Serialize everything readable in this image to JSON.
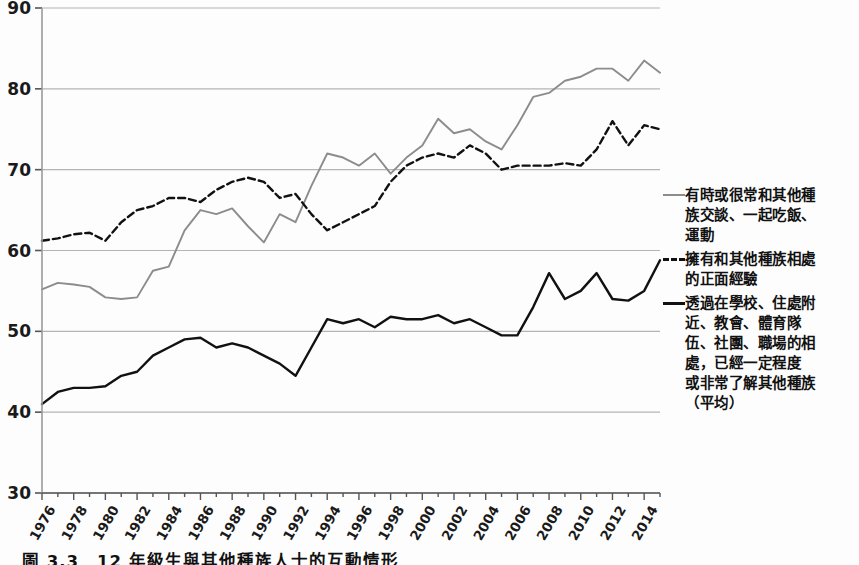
{
  "chart_data": {
    "type": "line",
    "title": "",
    "xlabel": "",
    "ylabel": "",
    "ylim": [
      30,
      90
    ],
    "xlim": [
      1976,
      2015
    ],
    "ytick_values": [
      30,
      40,
      50,
      60,
      70,
      80,
      90
    ],
    "ytick_labels": [
      "30",
      "40",
      "50",
      "60",
      "70",
      "80",
      "90"
    ],
    "grid": true,
    "grid_axis": "y",
    "legend_position": "right",
    "xtick_labels": [
      "1976",
      "1978",
      "1980",
      "1982",
      "1984",
      "1986",
      "1988",
      "1990",
      "1992",
      "1994",
      "1996",
      "1998",
      "2000",
      "2002",
      "2004",
      "2006",
      "2008",
      "2010",
      "2012",
      "2014"
    ],
    "x": [
      1976,
      1977,
      1978,
      1979,
      1980,
      1981,
      1982,
      1983,
      1984,
      1985,
      1986,
      1987,
      1988,
      1989,
      1990,
      1991,
      1992,
      1993,
      1994,
      1995,
      1996,
      1997,
      1998,
      1999,
      2000,
      2001,
      2002,
      2003,
      2004,
      2005,
      2006,
      2007,
      2008,
      2009,
      2010,
      2011,
      2012,
      2013,
      2014,
      2015
    ],
    "series": [
      {
        "name": "有時或很常和其他種族交談、一起吃飯、運動",
        "style": "solid",
        "color": "#8c8c8c",
        "values": [
          55.2,
          56.0,
          55.8,
          55.5,
          54.2,
          54.0,
          54.2,
          57.5,
          58.0,
          62.5,
          65.0,
          64.5,
          65.2,
          63.0,
          61.0,
          64.5,
          63.5,
          68.0,
          72.0,
          71.5,
          70.5,
          72.0,
          69.5,
          71.5,
          73.0,
          76.3,
          74.5,
          75.0,
          73.5,
          72.5,
          75.5,
          79.0,
          79.5,
          81.0,
          81.5,
          82.5,
          82.5,
          81.0,
          83.5,
          82.0
        ]
      },
      {
        "name": "擁有和其他種族相處的正面經驗",
        "style": "dashed",
        "color": "#111111",
        "values": [
          61.2,
          61.5,
          62.0,
          62.2,
          61.2,
          63.5,
          65.0,
          65.5,
          66.5,
          66.5,
          66.0,
          67.5,
          68.5,
          69.0,
          68.5,
          66.5,
          67.0,
          64.5,
          62.5,
          63.5,
          64.5,
          65.5,
          68.5,
          70.5,
          71.5,
          72.0,
          71.5,
          73.0,
          72.0,
          70.0,
          70.5,
          70.5,
          70.5,
          70.8,
          70.5,
          72.5,
          76.0,
          73.0,
          75.5,
          75.0
        ]
      },
      {
        "name": "透過在學校、住處附近、教會、體育隊伍、社團、職場的相處，已經一定程度或非常了解其他種族（平均）",
        "style": "solid",
        "color": "#111111",
        "values": [
          41.0,
          42.5,
          43.0,
          43.0,
          43.2,
          44.5,
          45.0,
          47.0,
          48.0,
          49.0,
          49.2,
          48.0,
          48.5,
          48.0,
          47.0,
          46.0,
          44.5,
          48.0,
          51.5,
          51.0,
          51.5,
          50.5,
          51.8,
          51.5,
          51.5,
          52.0,
          51.0,
          51.5,
          50.5,
          49.5,
          49.5,
          53.0,
          57.2,
          54.0,
          55.0,
          57.2,
          54.0,
          53.8,
          55.0,
          58.8
        ]
      }
    ]
  },
  "legend": {
    "items": [
      {
        "marker": "solid-gray-line",
        "lines": [
          "有時或很常和其他種",
          "族交談、一起吃飯、",
          "運動"
        ]
      },
      {
        "marker": "dashed-black-line",
        "lines": [
          "擁有和其他種族相處",
          "的正面經驗"
        ]
      },
      {
        "marker": "solid-black-line",
        "lines": [
          "透過在學校、住處附",
          "近、教會、體育隊",
          "伍、社團、職場的相",
          "處，已經一定程度",
          "或非常了解其他種族",
          "（平均）"
        ]
      }
    ]
  },
  "caption": {
    "text": "圖 3.3　12 年級生與其他種族人士的互動情形"
  }
}
